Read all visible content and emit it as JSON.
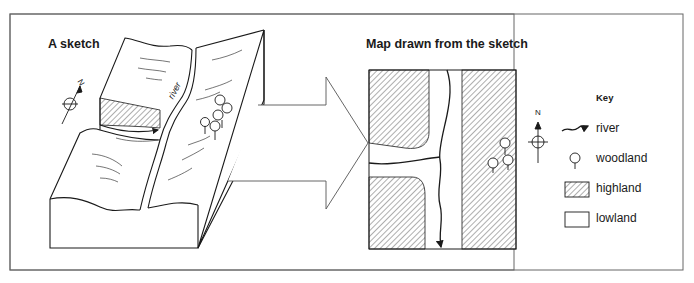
{
  "sketch": {
    "title": "A sketch",
    "river_label": "river",
    "north_label": "N"
  },
  "map": {
    "title": "Map drawn from the sketch",
    "north_label": "N"
  },
  "key": {
    "title": "Key",
    "items": [
      {
        "symbol": "river-arrow",
        "label": "river"
      },
      {
        "symbol": "tree",
        "label": "woodland"
      },
      {
        "symbol": "hatched-box",
        "label": "highland"
      },
      {
        "symbol": "empty-box",
        "label": "lowland"
      }
    ]
  },
  "colors": {
    "ink": "#1a1a1a",
    "frame": "#666666",
    "background": "#ffffff"
  }
}
